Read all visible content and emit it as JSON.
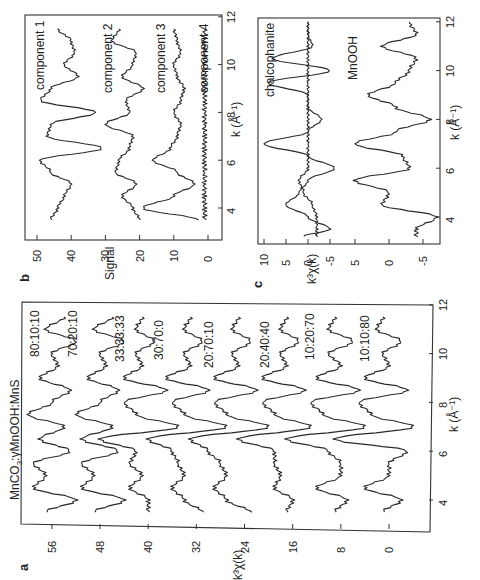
{
  "figure": {
    "panel_letters": {
      "a": "a",
      "b": "b",
      "c": "c"
    },
    "panel_a": {
      "title": "MnCO3:γMnOOH:MnS",
      "title_main": "MnCO",
      "title_sub": "3",
      "title_rest": ":γMnOOH:MnS",
      "xlabel": "k (Å⁻¹)",
      "ylabel": "k³χ(k)",
      "xticks": [
        "4",
        "6",
        "8",
        "10",
        "12"
      ],
      "yticks": [
        "0",
        "8",
        "16",
        "24",
        "32",
        "40",
        "48",
        "56"
      ],
      "curve_labels": [
        "80:10:10",
        "70:20:10",
        "33:33:33",
        "30:70:0",
        "20:70:10",
        "20:40:40",
        "10:20:70",
        "10:10:80"
      ]
    },
    "panel_b": {
      "xlabel": "k (Å⁻¹)",
      "ylabel": "Signal",
      "xticks": [
        "4",
        "6",
        "8",
        "10",
        "12"
      ],
      "yticks": [
        "0",
        "10",
        "20",
        "30",
        "40",
        "50"
      ],
      "curve_labels": [
        "component 1",
        "component 2",
        "component 3",
        "component 4"
      ]
    },
    "panel_c": {
      "xlabel": "k (Å⁻¹)",
      "ylabel": "k³χ(k)",
      "xticks": [
        "4",
        "6",
        "8",
        "10",
        "12"
      ],
      "yticks_upper": [
        "10",
        "5",
        "0",
        "-5"
      ],
      "yticks_lower": [
        "5",
        "0",
        "-5"
      ],
      "curve_labels": [
        "chalcophanite",
        "MnOOH"
      ]
    }
  },
  "chart_data": [
    {
      "panel": "a",
      "type": "line",
      "title": "MnCO3:γMnOOH:MnS",
      "xlabel": "k (Å⁻¹)",
      "ylabel": "k³χ(k)",
      "xlim": [
        3,
        12
      ],
      "ylim": [
        -4,
        60
      ],
      "note": "Spectra vertically offset by 8 units each; figure rotated 90° CCW",
      "x": [
        3.5,
        4.0,
        4.5,
        5.0,
        5.5,
        6.0,
        6.5,
        7.0,
        7.5,
        8.0,
        8.5,
        9.0,
        9.5,
        10.0,
        10.5,
        11.0,
        11.5
      ],
      "series": [
        {
          "name": "80:10:10",
          "offset": 56,
          "values": [
            57,
            52,
            59,
            57,
            59,
            53,
            58,
            54,
            60,
            56,
            53,
            58,
            55,
            56,
            52,
            57,
            54
          ]
        },
        {
          "name": "70:20:10",
          "offset": 48,
          "values": [
            49,
            44,
            51,
            49,
            51,
            45,
            51,
            46,
            52,
            48,
            45,
            50,
            47,
            48,
            44,
            49,
            46
          ]
        },
        {
          "name": "33:33:33",
          "offset": 40,
          "values": [
            40,
            40,
            43,
            41,
            43,
            42,
            48,
            35,
            42,
            44,
            37,
            44,
            41,
            42,
            39,
            42,
            41
          ]
        },
        {
          "name": "30:70:0",
          "offset": 32,
          "values": [
            31,
            34,
            36,
            34,
            35,
            36,
            40,
            27,
            34,
            36,
            30,
            37,
            33,
            34,
            31,
            34,
            33
          ]
        },
        {
          "name": "20:70:10",
          "offset": 24,
          "values": [
            23,
            27,
            29,
            27,
            28,
            30,
            33,
            20,
            27,
            29,
            22,
            29,
            25,
            26,
            23,
            26,
            25
          ]
        },
        {
          "name": "20:40:40",
          "offset": 16,
          "values": [
            17,
            16,
            19,
            18,
            19,
            19,
            25,
            13,
            19,
            21,
            14,
            21,
            17,
            18,
            15,
            18,
            17
          ]
        },
        {
          "name": "10:20:70",
          "offset": 8,
          "values": [
            9,
            7,
            12,
            8,
            8,
            10,
            17,
            4,
            11,
            13,
            5,
            12,
            8,
            10,
            6,
            10,
            9
          ]
        },
        {
          "name": "10:10:80",
          "offset": 0,
          "values": [
            1,
            -2,
            4,
            0,
            0,
            -3,
            9,
            -4,
            3,
            5,
            -3,
            4,
            0,
            1,
            -2,
            2,
            1
          ]
        }
      ]
    },
    {
      "panel": "b",
      "type": "line",
      "xlabel": "k (Å⁻¹)",
      "ylabel": "Signal",
      "xlim": [
        3,
        12
      ],
      "ylim": [
        0,
        52
      ],
      "x": [
        3.5,
        4.0,
        4.5,
        5.0,
        5.5,
        6.0,
        6.5,
        7.0,
        7.5,
        8.0,
        8.5,
        9.0,
        9.5,
        10.0,
        10.5,
        11.0,
        11.5
      ],
      "series": [
        {
          "name": "component 1",
          "values": [
            46,
            44,
            42,
            40,
            46,
            49,
            31,
            47,
            46,
            33,
            49,
            46,
            38,
            42,
            39,
            40,
            44
          ]
        },
        {
          "name": "component 2",
          "values": [
            20,
            22,
            25,
            21,
            27,
            26,
            23,
            22,
            30,
            23,
            24,
            19,
            25,
            22,
            21,
            28,
            26
          ]
        },
        {
          "name": "component 3",
          "values": [
            3,
            19,
            10,
            4,
            9,
            16,
            11,
            9,
            8,
            10,
            8,
            7,
            9,
            10,
            8,
            9,
            10
          ]
        },
        {
          "name": "component 4",
          "values": [
            1,
            1,
            1,
            1,
            1,
            1,
            1,
            1,
            1,
            1,
            1,
            1,
            1,
            1,
            1,
            1,
            1
          ]
        }
      ]
    },
    {
      "panel": "c",
      "type": "line",
      "xlabel": "k (Å⁻¹)",
      "ylabel": "k³χ(k)",
      "xlim": [
        3,
        12
      ],
      "x": [
        3.2,
        3.5,
        4.0,
        4.5,
        5.0,
        5.5,
        6.0,
        6.5,
        7.0,
        7.5,
        8.0,
        8.5,
        9.0,
        9.5,
        10.0,
        10.5,
        11.0,
        11.5,
        12.0
      ],
      "series": [
        {
          "name": "chalcophanite (upper, offset ~0)",
          "values": [
            1,
            -5,
            0,
            5,
            2,
            0,
            -6,
            0,
            10,
            0,
            -3,
            0,
            0,
            9,
            -5,
            8,
            -1,
            0,
            0
          ]
        },
        {
          "name": "chalcophanite-ref (upper, flat)",
          "values": [
            -2,
            -2,
            -2,
            -1,
            1,
            2,
            0,
            0,
            0,
            0,
            0,
            0,
            0,
            0,
            0,
            0,
            0,
            0,
            0
          ]
        },
        {
          "name": "MnOOH (lower)",
          "values": [
            -4,
            -4,
            -7,
            1,
            0,
            5,
            -3,
            -2,
            5,
            -1,
            -6,
            -1,
            3,
            -1,
            -3,
            -4,
            1,
            -4,
            -3
          ]
        }
      ]
    }
  ]
}
